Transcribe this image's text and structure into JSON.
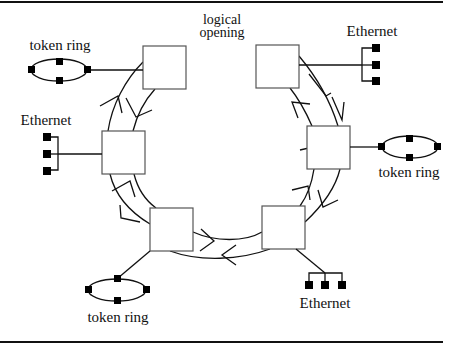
{
  "diagram": {
    "title_annotation": "logical\nopening",
    "annotation_line1": "logical",
    "annotation_line2": "opening",
    "colors": {
      "line": "#111111",
      "box_border": "#555555",
      "node": "#000000",
      "background": "#ffffff"
    },
    "bridges": [
      {
        "id": "bridge-top-left"
      },
      {
        "id": "bridge-top-right"
      },
      {
        "id": "bridge-left"
      },
      {
        "id": "bridge-right"
      },
      {
        "id": "bridge-bottom-left"
      },
      {
        "id": "bridge-bottom-right"
      }
    ],
    "networks": [
      {
        "id": "net-top-left",
        "type": "token-ring",
        "label": "token ring",
        "attached_to": "bridge-top-left"
      },
      {
        "id": "net-top-right",
        "type": "ethernet",
        "label": "Ethernet",
        "attached_to": "bridge-top-right"
      },
      {
        "id": "net-left",
        "type": "ethernet",
        "label": "Ethernet",
        "attached_to": "bridge-left"
      },
      {
        "id": "net-right",
        "type": "token-ring",
        "label": "token ring",
        "attached_to": "bridge-right"
      },
      {
        "id": "net-bottom-left",
        "type": "token-ring",
        "label": "token ring",
        "attached_to": "bridge-bottom-left"
      },
      {
        "id": "net-bottom-right",
        "type": "ethernet",
        "label": "Ethernet",
        "attached_to": "bridge-bottom-right"
      }
    ],
    "ring": {
      "description": "dual counter-rotating ring with logical opening at top"
    }
  }
}
